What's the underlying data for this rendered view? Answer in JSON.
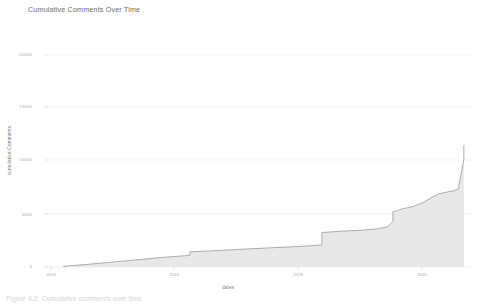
{
  "figure": {
    "caption": "Figure 4.2:  Cumulative comments over time",
    "background_color": "#ffffff"
  },
  "chart_data": {
    "type": "area",
    "title": "Cumulative Comments Over Time",
    "xlabel": "dates",
    "ylabel": "cumulative-Comments",
    "grid": true,
    "legend": null,
    "line_color": "#9a9a9a",
    "fill_color": "#e8e8e8",
    "ylim": [
      0,
      21500
    ],
    "yticks": [
      0,
      5000,
      10000,
      15000,
      20000
    ],
    "ytick_labels": [
      "0",
      "5000",
      "10000",
      "15000",
      "20000"
    ],
    "xlim": [
      "2013-10",
      "2020-10"
    ],
    "xticks": [
      "2014",
      "2016",
      "2018",
      "2020"
    ],
    "xtick_labels": [
      "2014",
      "2016",
      "2018",
      "2020"
    ],
    "x": [
      "2014-01",
      "2014-04",
      "2014-07",
      "2014-10",
      "2015-01",
      "2015-04",
      "2015-07",
      "2015-10",
      "2016-01",
      "2016-02",
      "2016-02",
      "2016-06",
      "2016-10",
      "2017-02",
      "2017-06",
      "2017-10",
      "2018-02",
      "2018-04",
      "2018-04",
      "2018-08",
      "2018-12",
      "2019-03",
      "2019-05",
      "2019-06",
      "2019-06",
      "2019-08",
      "2019-10",
      "2019-12",
      "2020-03",
      "2020-06",
      "2020-07",
      "2020-07",
      "2020-08",
      "2020-08"
    ],
    "values": [
      60,
      180,
      300,
      430,
      560,
      700,
      840,
      960,
      1060,
      1100,
      1430,
      1520,
      1620,
      1720,
      1810,
      1900,
      2010,
      2090,
      3250,
      3380,
      3480,
      3600,
      3800,
      4300,
      5200,
      5500,
      5700,
      6100,
      6900,
      7200,
      7400,
      7700,
      10100,
      11500
    ],
    "annotations": [
      {
        "label": "step jump early 2016",
        "x": "2016-02",
        "from": 1100,
        "to": 1430
      },
      {
        "label": "step jump early 2018",
        "x": "2018-04",
        "from": 2090,
        "to": 3250
      },
      {
        "label": "steep rise mid 2019",
        "x": "2019-06",
        "from": 3800,
        "to": 5200
      },
      {
        "label": "vertical spike mid 2020",
        "x": "2020-07",
        "from": 7700,
        "to": 11500
      }
    ]
  }
}
